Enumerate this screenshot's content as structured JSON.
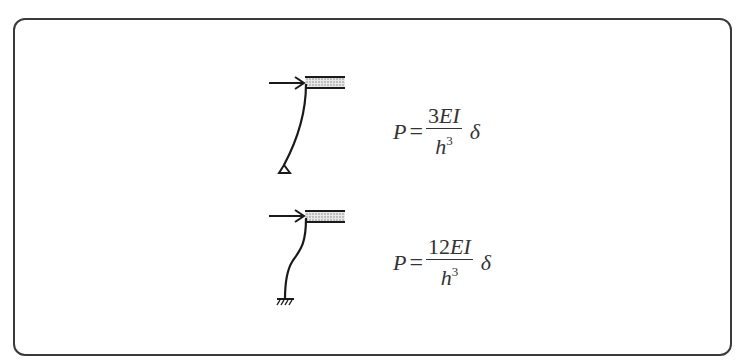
{
  "diagram": {
    "cases": [
      {
        "support": "pinned",
        "load_label": "P",
        "formula": {
          "lhs": "P",
          "eq": "=",
          "num_coef": "3",
          "num_vars": "EI",
          "den_var": "h",
          "den_exp": "3",
          "factor": "δ"
        }
      },
      {
        "support": "fixed",
        "load_label": "P",
        "formula": {
          "lhs": "P",
          "eq": "=",
          "num_coef": "12",
          "num_vars": "EI",
          "den_var": "h",
          "den_exp": "3",
          "factor": "δ"
        }
      }
    ],
    "colors": {
      "line": "#1a1a1a",
      "frame": "#3a3a3a",
      "beam_fill": "#bdbdbd"
    }
  }
}
